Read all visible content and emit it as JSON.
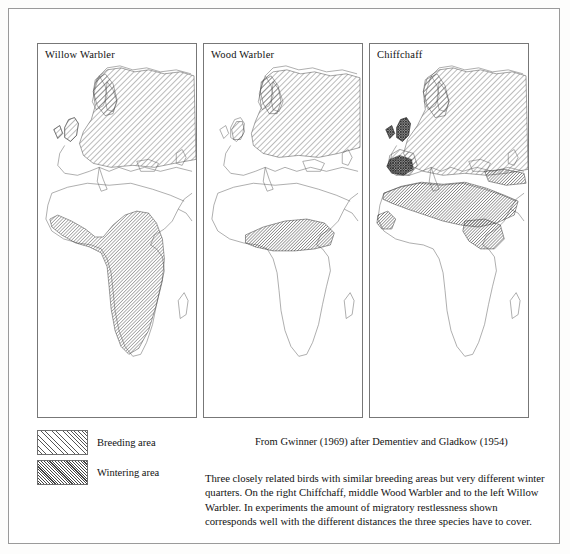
{
  "figure": {
    "type": "map-figure",
    "panels": [
      {
        "id": "willow-warbler",
        "title": "Willow Warbler",
        "breeding_region": "Europe and northern Asia, including Scandinavia, British Isles, Siberia",
        "wintering_region": "Sub-Saharan Africa, nearly the whole continent south of the Sahara",
        "migration_distance": "longest"
      },
      {
        "id": "wood-warbler",
        "title": "Wood Warbler",
        "breeding_region": "Europe and western Russia, patchier than Willow Warbler",
        "wintering_region": "Narrow equatorial belt across central Africa",
        "migration_distance": "intermediate"
      },
      {
        "id": "chiffchaff",
        "title": "Chiffchaff",
        "breeding_region": "Europe and Asia; resident overlap in Britain and Iberia",
        "wintering_region": "North Africa, Sahel and Mediterranean rim",
        "migration_distance": "shortest"
      }
    ]
  },
  "legend": {
    "items": [
      {
        "key": "breeding",
        "label": "Breeding area",
        "pattern": "diagonal-hatch"
      },
      {
        "key": "wintering",
        "label": "Wintering area",
        "pattern": "dense-diagonal-hatch"
      }
    ]
  },
  "source": {
    "line": "From Gwinner (1969) after Dementiev and Gladkow (1954)"
  },
  "caption": {
    "text": "Three closely related birds with similar breeding areas but very different winter quarters. On the right Chiffchaff, middle Wood Warbler and to the left Willow Warbler. In experiments the amount of migratory restlessness shown corresponds well with the different distances the three species have to cover."
  },
  "colors": {
    "ink": "#111111",
    "coastline": "#6b6b6b",
    "panel_border": "#777777",
    "page_border": "#9a9a9a",
    "paper": "#ffffff"
  }
}
